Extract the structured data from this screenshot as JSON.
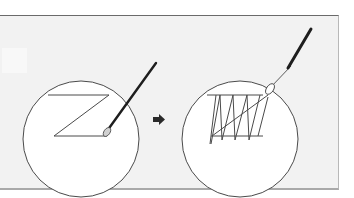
{
  "figure": {
    "colors": {
      "background": "#ffffff",
      "panel": "#f2f2f2",
      "panel_top_border": "#6a6a6a",
      "circle_fill": "#ffffff",
      "line": "#4a4a4a",
      "needle": "#1e1e1e",
      "needle_eye_fill": "#d0d0d0",
      "arrow": "#2a2a2a"
    },
    "step1": {
      "label": "",
      "shape": "z-stitch",
      "circle": {
        "cx": 81,
        "cy": 139,
        "r": 58
      }
    },
    "arrow": {
      "direction": "right",
      "icon": "arrow-right-icon"
    },
    "step2": {
      "label": "",
      "shape": "zigzag-stitches",
      "circle": {
        "cx": 240,
        "cy": 139,
        "r": 58
      }
    }
  }
}
